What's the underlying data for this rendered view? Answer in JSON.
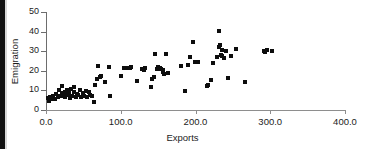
{
  "chart_data": {
    "type": "scatter",
    "title": "",
    "xlabel": "Exports",
    "ylabel": "Emigration",
    "xlim": [
      0.0,
      400.0
    ],
    "ylim": [
      0,
      50
    ],
    "xticks": [
      "0.0",
      "100.0",
      "200.0",
      "300.0",
      "400.0"
    ],
    "xtick_values": [
      0,
      100,
      200,
      300,
      400
    ],
    "yticks": [
      "0",
      "10",
      "20",
      "30",
      "40",
      "50"
    ],
    "ytick_values": [
      0,
      10,
      20,
      30,
      40,
      50
    ],
    "grid": false,
    "legend": null,
    "marker": "square",
    "marker_color": "#0d0d0d",
    "points": [
      [
        3,
        6
      ],
      [
        4,
        4.5
      ],
      [
        6,
        6.5
      ],
      [
        8,
        5.5
      ],
      [
        10,
        7
      ],
      [
        12,
        5.5
      ],
      [
        14,
        8
      ],
      [
        16,
        6.5
      ],
      [
        18,
        10
      ],
      [
        19,
        7
      ],
      [
        21,
        8.5
      ],
      [
        22,
        12
      ],
      [
        24,
        7
      ],
      [
        25,
        9
      ],
      [
        26,
        6.5
      ],
      [
        28,
        10
      ],
      [
        29,
        7.5
      ],
      [
        31,
        8.5
      ],
      [
        32,
        6
      ],
      [
        34,
        10.5
      ],
      [
        35,
        7
      ],
      [
        37,
        9
      ],
      [
        38,
        11.5
      ],
      [
        40,
        6.5
      ],
      [
        41,
        8
      ],
      [
        43,
        7.5
      ],
      [
        45,
        10
      ],
      [
        47,
        6.5
      ],
      [
        49,
        8.5
      ],
      [
        51,
        7
      ],
      [
        53,
        9.5
      ],
      [
        55,
        6.5
      ],
      [
        57,
        9
      ],
      [
        59,
        7.5
      ],
      [
        62,
        7
      ],
      [
        64,
        4
      ],
      [
        66,
        13
      ],
      [
        68,
        16
      ],
      [
        70,
        22.5
      ],
      [
        72,
        17
      ],
      [
        74,
        17.5
      ],
      [
        79,
        14.5
      ],
      [
        84,
        22
      ],
      [
        86,
        7
      ],
      [
        101,
        17.5
      ],
      [
        104,
        21.5
      ],
      [
        107,
        21.5
      ],
      [
        112,
        21.5
      ],
      [
        114,
        22
      ],
      [
        122,
        15
      ],
      [
        128,
        21
      ],
      [
        131,
        20.5
      ],
      [
        133,
        21.5
      ],
      [
        140,
        11.5
      ],
      [
        142,
        16
      ],
      [
        144,
        17
      ],
      [
        146,
        28.5
      ],
      [
        148,
        21
      ],
      [
        150,
        22
      ],
      [
        152,
        21.5
      ],
      [
        154,
        21
      ],
      [
        156,
        19.5
      ],
      [
        157,
        20.5
      ],
      [
        158,
        18.5
      ],
      [
        160,
        28.5
      ],
      [
        163,
        19
      ],
      [
        181,
        22.5
      ],
      [
        186,
        9.5
      ],
      [
        190,
        23
      ],
      [
        192,
        27
      ],
      [
        196,
        34.5
      ],
      [
        199,
        24.5
      ],
      [
        203,
        24.5
      ],
      [
        215,
        12
      ],
      [
        217,
        13
      ],
      [
        221,
        15.5
      ],
      [
        224,
        24
      ],
      [
        229,
        27
      ],
      [
        231,
        40.5
      ],
      [
        232,
        32
      ],
      [
        233,
        33
      ],
      [
        234,
        28
      ],
      [
        235,
        30.5
      ],
      [
        236,
        27.5
      ],
      [
        238,
        26.5
      ],
      [
        241,
        30
      ],
      [
        244,
        16.5
      ],
      [
        248,
        27.5
      ],
      [
        254,
        31
      ],
      [
        266,
        14.5
      ],
      [
        291,
        30
      ],
      [
        293,
        29.5
      ],
      [
        295,
        30.5
      ],
      [
        303,
        30
      ]
    ]
  },
  "axis": {
    "x_title": "Exports",
    "y_title": "Emigration"
  }
}
